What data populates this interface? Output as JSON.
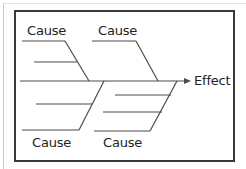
{
  "diagram": {
    "type": "fishbone",
    "effect_label": "Effect",
    "causes": [
      {
        "position": "top-left",
        "label": "Cause"
      },
      {
        "position": "top-right",
        "label": "Cause"
      },
      {
        "position": "bottom-left",
        "label": "Cause"
      },
      {
        "position": "bottom-right",
        "label": "Cause"
      }
    ],
    "colors": {
      "line": "#4a4a4a",
      "frame": "#3a3a3a",
      "text": "#222222"
    }
  }
}
